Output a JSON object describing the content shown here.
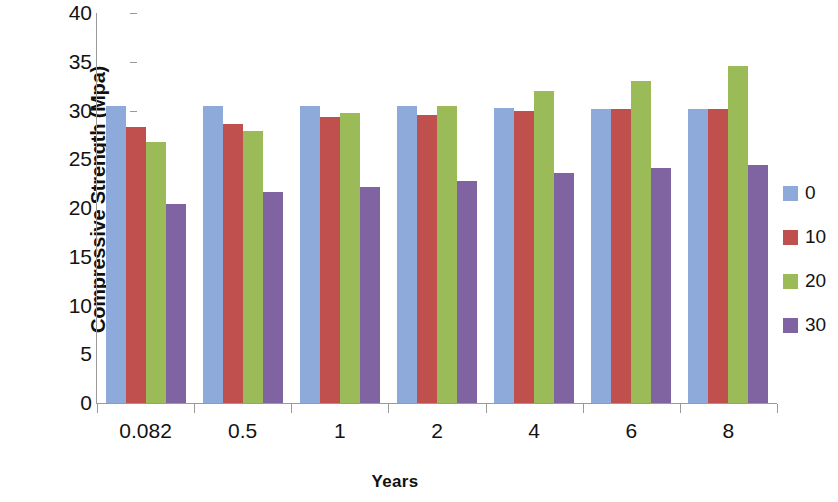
{
  "chart_data": {
    "type": "bar",
    "title": "",
    "xlabel": "Years",
    "ylabel": "Compressive Strength (Mpa)",
    "categories": [
      "0.082",
      "0.5",
      "1",
      "2",
      "4",
      "6",
      "8"
    ],
    "series": [
      {
        "name": "0",
        "color": "#8eaadb",
        "values": [
          30.5,
          30.5,
          30.5,
          30.5,
          30.3,
          30.2,
          30.2
        ]
      },
      {
        "name": "10",
        "color": "#c0504d",
        "values": [
          28.3,
          28.6,
          29.3,
          29.5,
          30.0,
          30.2,
          30.2
        ]
      },
      {
        "name": "20",
        "color": "#9bbb59",
        "values": [
          26.8,
          27.9,
          29.7,
          30.5,
          32.0,
          33.0,
          34.6
        ]
      },
      {
        "name": "30",
        "color": "#8064a2",
        "values": [
          20.4,
          21.6,
          22.2,
          22.8,
          23.6,
          24.1,
          24.4
        ]
      }
    ],
    "ylim": [
      0,
      40
    ],
    "y_ticks": [
      "40",
      "35",
      "30",
      "25",
      "20",
      "15",
      "10",
      "5",
      "0"
    ],
    "y_tick_values": [
      40,
      35,
      30,
      25,
      20,
      15,
      10,
      5,
      0
    ],
    "grid": false,
    "legend_position": "right",
    "legend_entries": [
      "0",
      "10",
      "20",
      "30"
    ]
  }
}
